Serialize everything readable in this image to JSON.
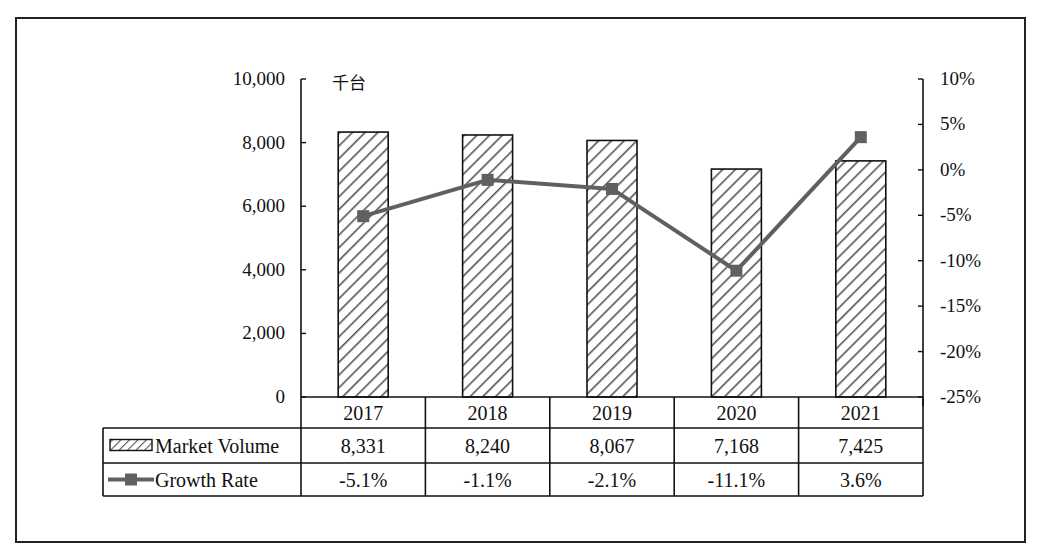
{
  "chart_data": {
    "type": "bar+line",
    "categories": [
      "2017",
      "2018",
      "2019",
      "2020",
      "2021"
    ],
    "series": [
      {
        "name": "Market Volume",
        "type": "bar",
        "axis": "left",
        "values": [
          8331,
          8240,
          8067,
          7168,
          7425
        ],
        "display": [
          "8,331",
          "8,240",
          "8,067",
          "7,168",
          "7,425"
        ],
        "pattern": "diagonal-hatch"
      },
      {
        "name": "Growth Rate",
        "type": "line",
        "axis": "right",
        "values": [
          -5.1,
          -1.1,
          -2.1,
          -11.1,
          3.6
        ],
        "display": [
          "-5.1%",
          "-1.1%",
          "-2.1%",
          "-11.1%",
          "3.6%"
        ],
        "marker": "square",
        "color": "#606060"
      }
    ],
    "unit_label": "千台",
    "left_axis": {
      "ylim": [
        0,
        10000
      ],
      "ticks": [
        0,
        2000,
        4000,
        6000,
        8000,
        10000
      ],
      "tick_labels": [
        "0",
        "2,000",
        "4,000",
        "6,000",
        "8,000",
        "10,000"
      ]
    },
    "right_axis": {
      "ylim": [
        -25,
        10
      ],
      "ticks": [
        -25,
        -20,
        -15,
        -10,
        -5,
        0,
        5,
        10
      ],
      "tick_labels": [
        "-25%",
        "-20%",
        "-15%",
        "-10%",
        "-5%",
        "0%",
        "5%",
        "10%"
      ]
    },
    "data_table": {
      "rows": [
        {
          "label": "Market Volume",
          "values": [
            "8,331",
            "8,240",
            "8,067",
            "7,168",
            "7,425"
          ]
        },
        {
          "label": "Growth Rate",
          "values": [
            "-5.1%",
            "-1.1%",
            "-2.1%",
            "-11.1%",
            "3.6%"
          ]
        }
      ]
    },
    "grid": false,
    "legend_position": "data-table"
  },
  "colors": {
    "line": "#606060",
    "bar_stroke": "#111111",
    "hatch": "#555555",
    "frame": "#222222"
  }
}
